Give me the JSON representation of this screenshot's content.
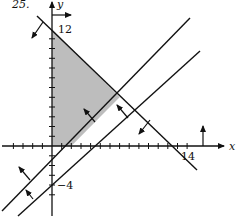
{
  "problem_number": "25.",
  "axes": {
    "x_label": "x",
    "y_label": "y",
    "x_tick_label": "14",
    "y_tick_label_top": "12",
    "y_tick_label_bottom": "−4"
  },
  "lines": [
    {
      "equation": "x + y = 12",
      "arrow_direction": "down-left"
    },
    {
      "equation": "y = x - 2",
      "arrow_direction": "up-left"
    },
    {
      "equation": "y = x - 4",
      "arrow_direction": "up-left"
    },
    {
      "equation": "x = 0",
      "arrow_direction": "right"
    },
    {
      "equation": "y = 0",
      "arrow_direction": "up"
    }
  ],
  "feasible_region": {
    "vertices": [
      [
        0,
        0
      ],
      [
        0,
        12
      ],
      [
        7,
        5
      ],
      [
        2,
        0
      ]
    ],
    "fill": "#bdbdbd"
  },
  "colors": {
    "ink": "#111111",
    "shade": "#bdbdbd"
  }
}
